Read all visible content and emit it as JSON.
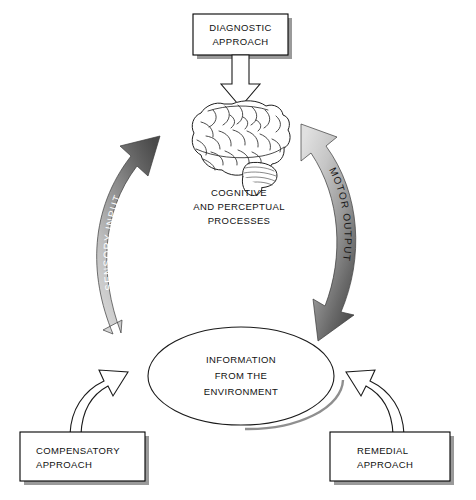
{
  "figure": {
    "type": "cycle-diagram",
    "background_color": "#ffffff",
    "title_present": false
  },
  "nodes": {
    "top_box": {
      "name": "diagnostic-approach",
      "line1": "DIAGNOSTIC",
      "line2": "APPROACH",
      "text_align": "center"
    },
    "brain": {
      "name": "brain-illustration",
      "caption_line1": "COGNITIVE",
      "caption_line2": "AND PERCEPTUAL",
      "caption_line3": "PROCESSES"
    },
    "center_ellipse": {
      "name": "information-from-the-environment",
      "line1": "INFORMATION",
      "line2": "FROM THE",
      "line3": "ENVIRONMENT"
    },
    "bottom_left_box": {
      "name": "compensatory-approach",
      "line1": "COMPENSATORY",
      "line2": "APPROACH",
      "text_align": "left"
    },
    "bottom_right_box": {
      "name": "remedial-approach",
      "line1": "REMEDIAL",
      "line2": "APPROACH",
      "text_align": "left"
    }
  },
  "arrows": {
    "diagnostic_to_brain": {
      "name": "diagnostic-to-brain-arrow",
      "style": "hollow-outline",
      "direction": "down",
      "label": ""
    },
    "sensory_input": {
      "name": "sensory-input-arrow",
      "style": "curved-gradient",
      "direction": "up",
      "label": "SENSORY INPUT",
      "label_color": "#ffffff",
      "gradient_from": "#d4d4d4",
      "gradient_to": "#4f4f4f",
      "from": "information-from-the-environment",
      "to": "brain"
    },
    "motor_output": {
      "name": "motor-output-arrow",
      "style": "curved-gradient",
      "direction": "down",
      "label": "MOTOR OUTPUT",
      "label_color": "#1a1a1a",
      "gradient_from": "#dcdcdc",
      "gradient_to": "#4a4a4a",
      "from": "brain",
      "to": "information-from-the-environment"
    },
    "compensatory_to_center": {
      "name": "compensatory-to-environment-arrow",
      "style": "hollow-outline-curved",
      "direction": "up-right",
      "label": ""
    },
    "remedial_to_center": {
      "name": "remedial-to-environment-arrow",
      "style": "hollow-outline-curved",
      "direction": "up-left",
      "label": ""
    }
  },
  "colors": {
    "ink": "#1a1a1a",
    "box_shadow": "#9a9a9a",
    "arrow_dark": "#4f4f4f",
    "arrow_light": "#d4d4d4",
    "page_background": "#ffffff"
  }
}
